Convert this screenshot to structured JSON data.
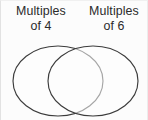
{
  "figure": {
    "kind": "venn-diagram",
    "background_color": "#fcfcfc",
    "border_color": "#e8e8e8",
    "stroke_color": "#3c3c3c",
    "fill_color": "#fdfdfd"
  },
  "labels": {
    "left": {
      "line1": "Multiples",
      "line2": "of 4",
      "full": "Multiples of 4"
    },
    "right": {
      "line1": "Multiples",
      "line2": "of 6",
      "full": "Multiples of 6"
    }
  },
  "chart_data": {
    "type": "diagram",
    "diagram": "venn",
    "title": "",
    "sets": [
      {
        "name": "Multiples of 4",
        "label_line1": "Multiples",
        "label_line2": "of 4",
        "shape": "ellipse",
        "cx": 57,
        "cy": 80,
        "rx": 45,
        "ry": 35,
        "items": []
      },
      {
        "name": "Multiples of 6",
        "label_line1": "Multiples",
        "label_line2": "of 6",
        "shape": "ellipse",
        "cx": 92,
        "cy": 80,
        "rx": 45,
        "ry": 35,
        "items": []
      }
    ],
    "intersection": {
      "label": "",
      "items": []
    }
  }
}
